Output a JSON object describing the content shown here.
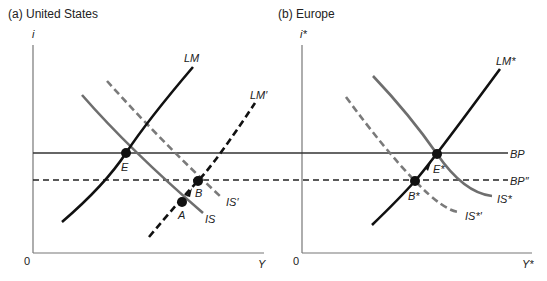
{
  "panels": [
    {
      "title": "(a) United States",
      "y_axis_label": "i",
      "x_axis_label": "Y",
      "origin_label": "0",
      "curves": {
        "LM": "LM",
        "LM_prime": "LM′",
        "IS": "IS",
        "IS_prime": "IS′"
      },
      "points": {
        "E": "E",
        "A": "A",
        "B": "B"
      }
    },
    {
      "title": "(b) Europe",
      "y_axis_label": "i*",
      "x_axis_label": "Y*",
      "origin_label": "0",
      "curves": {
        "LM": "LM*",
        "IS": "IS*",
        "IS_prime": "IS*′",
        "BP": "BP",
        "BP_prime": "BP″"
      },
      "points": {
        "E": "E*",
        "B": "B*"
      }
    }
  ],
  "colors": {
    "solid_curve": "#111111",
    "gray_curve": "#6e6e6e",
    "dashed_gray": "#7a7a7a",
    "axis": "#777777"
  }
}
